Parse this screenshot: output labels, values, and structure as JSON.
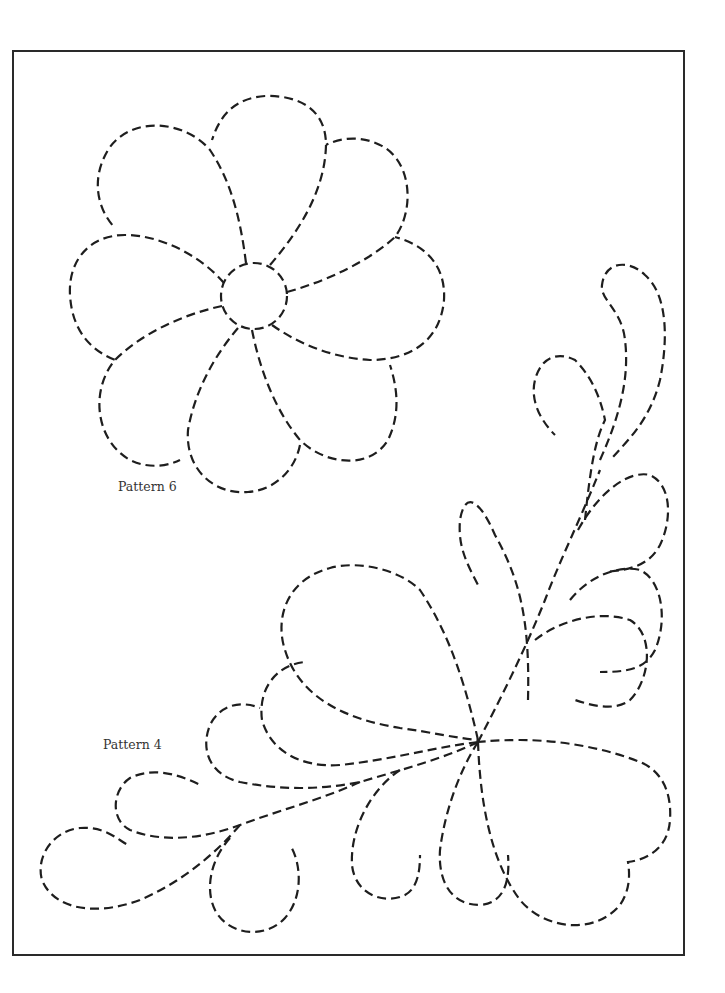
{
  "page": {
    "background": "#ffffff",
    "border_color": "#2a2a2a",
    "line_color": "#1e1e1e"
  },
  "patterns": [
    {
      "id": "pattern-6",
      "label": "Pattern 6",
      "type": "flower",
      "petals": 8,
      "center": "circle"
    },
    {
      "id": "pattern-4",
      "label": "Pattern 4",
      "type": "feather-plume",
      "plumes": 11
    }
  ]
}
